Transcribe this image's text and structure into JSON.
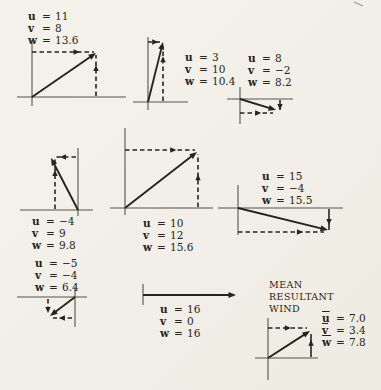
{
  "colors": {
    "paper": "#f3f0e9",
    "ink": "#272420",
    "axis": "#56524a",
    "artifact": "#b6b2a8"
  },
  "heading": {
    "lines": [
      "MEAN",
      "RESULTANT",
      "WIND"
    ]
  },
  "scan_mark": {
    "x1": 354,
    "y1": 2,
    "x2": 363,
    "y2": 6
  },
  "diagrams": [
    {
      "name": "vector-diagram-1",
      "values": [
        {
          "var": "u",
          "val": "11"
        },
        {
          "var": "v",
          "val": "8"
        },
        {
          "var": "w",
          "val": "13.6"
        }
      ],
      "label_pos": {
        "x": 28,
        "y": 10
      },
      "axes": [
        {
          "x1": 17,
          "y1": 97,
          "x2": 126,
          "y2": 97
        },
        {
          "x1": 32,
          "y1": 40,
          "x2": 32,
          "y2": 106
        }
      ],
      "vector": {
        "x1": 32,
        "y1": 97,
        "x2": 96,
        "y2": 53
      },
      "components": [
        {
          "dashed": true,
          "x1": 32,
          "y1": 52,
          "x2": 94,
          "y2": 52,
          "t": 0.72
        },
        {
          "dashed": true,
          "x1": 96,
          "y1": 96,
          "x2": 96,
          "y2": 55,
          "t": 0.68
        }
      ]
    },
    {
      "name": "vector-diagram-2",
      "values": [
        {
          "var": "u",
          "val": "3"
        },
        {
          "var": "v",
          "val": "10"
        },
        {
          "var": "w",
          "val": "10.4"
        }
      ],
      "label_pos": {
        "x": 185,
        "y": 51
      },
      "axes": [
        {
          "x1": 133,
          "y1": 102,
          "x2": 188,
          "y2": 102
        },
        {
          "x1": 148,
          "y1": 37,
          "x2": 148,
          "y2": 110
        }
      ],
      "vector": {
        "x1": 148,
        "y1": 102,
        "x2": 163,
        "y2": 42
      },
      "components": [
        {
          "dashed": true,
          "x1": 148,
          "y1": 42,
          "x2": 160,
          "y2": 42,
          "t": 0.6
        },
        {
          "dashed": true,
          "x1": 163,
          "y1": 101,
          "x2": 163,
          "y2": 46,
          "t": 0.76
        }
      ]
    },
    {
      "name": "vector-diagram-3",
      "values": [
        {
          "var": "u",
          "val": "8"
        },
        {
          "var": "v",
          "val": "−2"
        },
        {
          "var": "w",
          "val": "8.2"
        }
      ],
      "label_pos": {
        "x": 248,
        "y": 52
      },
      "axes": [
        {
          "x1": 227,
          "y1": 99,
          "x2": 293,
          "y2": 99
        },
        {
          "x1": 240,
          "y1": 87,
          "x2": 240,
          "y2": 124
        }
      ],
      "vector": {
        "x1": 240,
        "y1": 99,
        "x2": 276,
        "y2": 110
      },
      "components": [
        {
          "dashed": false,
          "x1": 280,
          "y1": 100,
          "x2": 280,
          "y2": 110,
          "t": 1
        },
        {
          "dashed": true,
          "x1": 240,
          "y1": 113,
          "x2": 273,
          "y2": 113,
          "t": 0.55
        }
      ]
    },
    {
      "name": "vector-diagram-4",
      "values": [
        {
          "var": "u",
          "val": "−4"
        },
        {
          "var": "v",
          "val": "9"
        },
        {
          "var": "w",
          "val": "9.8"
        }
      ],
      "label_pos": {
        "x": 32,
        "y": 215
      },
      "axes": [
        {
          "x1": 20,
          "y1": 210,
          "x2": 93,
          "y2": 210
        },
        {
          "x1": 78,
          "y1": 148,
          "x2": 78,
          "y2": 216
        }
      ],
      "vector": {
        "x1": 78,
        "y1": 210,
        "x2": 51,
        "y2": 158
      },
      "components": [
        {
          "dashed": true,
          "x1": 55,
          "y1": 209,
          "x2": 55,
          "y2": 159,
          "t": 0.72
        },
        {
          "dashed": true,
          "x1": 76,
          "y1": 157,
          "x2": 54,
          "y2": 157,
          "t": 0.59
        }
      ]
    },
    {
      "name": "vector-diagram-5",
      "values": [
        {
          "var": "u",
          "val": "10"
        },
        {
          "var": "v",
          "val": "12"
        },
        {
          "var": "w",
          "val": "15.6"
        }
      ],
      "label_pos": {
        "x": 143,
        "y": 217
      },
      "axes": [
        {
          "x1": 110,
          "y1": 208,
          "x2": 213,
          "y2": 208
        },
        {
          "x1": 125,
          "y1": 128,
          "x2": 125,
          "y2": 215
        }
      ],
      "vector": {
        "x1": 125,
        "y1": 208,
        "x2": 197,
        "y2": 152
      },
      "components": [
        {
          "dashed": true,
          "x1": 125,
          "y1": 150,
          "x2": 195,
          "y2": 150,
          "t": 0.69
        },
        {
          "dashed": true,
          "x1": 198,
          "y1": 207,
          "x2": 198,
          "y2": 154,
          "t": 0.56
        }
      ]
    },
    {
      "name": "vector-diagram-6",
      "values": [
        {
          "var": "u",
          "val": "15"
        },
        {
          "var": "v",
          "val": "−4"
        },
        {
          "var": "w",
          "val": "15.5"
        }
      ],
      "label_pos": {
        "x": 262,
        "y": 170
      },
      "axes": [
        {
          "x1": 218,
          "y1": 208,
          "x2": 343,
          "y2": 208
        },
        {
          "x1": 238,
          "y1": 185,
          "x2": 238,
          "y2": 235
        }
      ],
      "vector": {
        "x1": 238,
        "y1": 208,
        "x2": 328,
        "y2": 230
      },
      "components": [
        {
          "dashed": false,
          "x1": 329,
          "y1": 209,
          "x2": 329,
          "y2": 230,
          "t": 0.62
        },
        {
          "dashed": true,
          "x1": 238,
          "y1": 232,
          "x2": 324,
          "y2": 232,
          "t": 0.72
        }
      ]
    },
    {
      "name": "vector-diagram-7",
      "values": [
        {
          "var": "u",
          "val": "−5"
        },
        {
          "var": "v",
          "val": "−4"
        },
        {
          "var": "w",
          "val": "6.4"
        }
      ],
      "label_pos": {
        "x": 35,
        "y": 257
      },
      "axes": [
        {
          "x1": 17,
          "y1": 297,
          "x2": 87,
          "y2": 297
        },
        {
          "x1": 75,
          "y1": 287,
          "x2": 75,
          "y2": 327
        }
      ],
      "vector": {
        "x1": 75,
        "y1": 297,
        "x2": 50,
        "y2": 316
      },
      "components": [
        {
          "dashed": true,
          "x1": 48,
          "y1": 299,
          "x2": 48,
          "y2": 313,
          "t": 1
        },
        {
          "dashed": true,
          "x1": 72,
          "y1": 318,
          "x2": 53,
          "y2": 318,
          "t": 0.53
        }
      ]
    },
    {
      "name": "vector-diagram-8",
      "values": [
        {
          "var": "u",
          "val": "16"
        },
        {
          "var": "v",
          "val": "0"
        },
        {
          "var": "w",
          "val": "16"
        }
      ],
      "label_pos": {
        "x": 160,
        "y": 303
      },
      "axes": [
        {
          "x1": 143,
          "y1": 284,
          "x2": 143,
          "y2": 305
        }
      ],
      "vector": {
        "x1": 143,
        "y1": 295,
        "x2": 236,
        "y2": 295
      },
      "components": []
    },
    {
      "name": "vector-diagram-mean",
      "values": [
        {
          "var": "u",
          "bar": true,
          "val": "7.0"
        },
        {
          "var": "v",
          "bar": true,
          "val": "3.4"
        },
        {
          "var": "w",
          "bar": true,
          "val": "7.8"
        }
      ],
      "label_pos": {
        "x": 322,
        "y": 312
      },
      "axes": [
        {
          "x1": 255,
          "y1": 358,
          "x2": 318,
          "y2": 358
        },
        {
          "x1": 268,
          "y1": 318,
          "x2": 268,
          "y2": 380
        }
      ],
      "vector": {
        "x1": 268,
        "y1": 358,
        "x2": 310,
        "y2": 331
      },
      "components": [
        {
          "dashed": true,
          "x1": 268,
          "y1": 328,
          "x2": 307,
          "y2": 328,
          "t": 0.51
        },
        {
          "dashed": false,
          "x1": 311,
          "y1": 357,
          "x2": 311,
          "y2": 334,
          "t": 0.62
        }
      ]
    }
  ]
}
